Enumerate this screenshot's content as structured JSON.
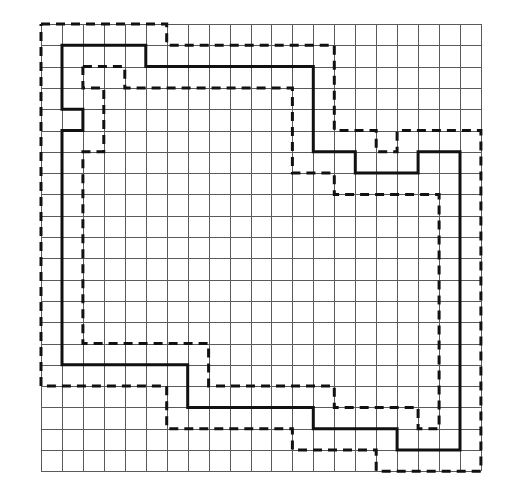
{
  "diagram": {
    "type": "grid-boundary-diagram",
    "grid": {
      "columns": 21,
      "rows": 21,
      "origin_x": 41,
      "origin_y": 24,
      "cell_width": 20.95,
      "cell_height": 21.3,
      "line_color": "#5a5a5a"
    },
    "paths": [
      {
        "name": "outer-dashed-boundary",
        "style": "dashed",
        "color": "#111111",
        "points": [
          [
            0,
            0
          ],
          [
            6,
            0
          ],
          [
            6,
            1
          ],
          [
            14,
            1
          ],
          [
            14,
            5
          ],
          [
            16,
            5
          ],
          [
            16,
            6
          ],
          [
            17,
            6
          ],
          [
            17,
            5
          ],
          [
            21,
            5
          ],
          [
            21,
            21
          ],
          [
            16,
            21
          ],
          [
            16,
            20
          ],
          [
            12,
            20
          ],
          [
            12,
            19
          ],
          [
            6,
            19
          ],
          [
            6,
            17
          ],
          [
            0,
            17
          ],
          [
            0,
            0
          ]
        ]
      },
      {
        "name": "solid-boundary",
        "style": "solid",
        "color": "#111111",
        "points": [
          [
            1,
            1
          ],
          [
            5,
            1
          ],
          [
            5,
            2
          ],
          [
            13,
            2
          ],
          [
            13,
            6
          ],
          [
            15,
            6
          ],
          [
            15,
            7
          ],
          [
            18,
            7
          ],
          [
            18,
            6
          ],
          [
            20,
            6
          ],
          [
            20,
            20
          ],
          [
            17,
            20
          ],
          [
            17,
            19
          ],
          [
            13,
            19
          ],
          [
            13,
            18
          ],
          [
            7,
            18
          ],
          [
            7,
            16
          ],
          [
            1,
            16
          ],
          [
            1,
            5
          ],
          [
            2,
            5
          ],
          [
            2,
            4
          ],
          [
            1,
            4
          ],
          [
            1,
            1
          ]
        ]
      },
      {
        "name": "inner-dashed-boundary",
        "style": "dashed",
        "color": "#111111",
        "points": [
          [
            2,
            2
          ],
          [
            4,
            2
          ],
          [
            4,
            3
          ],
          [
            12,
            3
          ],
          [
            12,
            7
          ],
          [
            14,
            7
          ],
          [
            14,
            8
          ],
          [
            19,
            8
          ],
          [
            19,
            19
          ],
          [
            18,
            19
          ],
          [
            18,
            18
          ],
          [
            14,
            18
          ],
          [
            14,
            17
          ],
          [
            8,
            17
          ],
          [
            8,
            15
          ],
          [
            2,
            15
          ],
          [
            2,
            6
          ],
          [
            3,
            6
          ],
          [
            3,
            3
          ],
          [
            2,
            3
          ],
          [
            2,
            2
          ]
        ]
      }
    ]
  }
}
